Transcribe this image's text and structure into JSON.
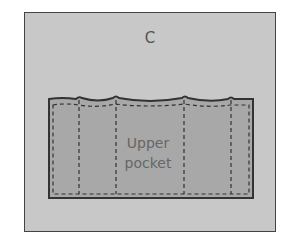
{
  "diagram": {
    "panel_label": "C",
    "pocket": {
      "label_line1": "Upper",
      "label_line2": "pocket"
    },
    "colors": {
      "background": "#c8c8c8",
      "pocket_fill": "#a8a8a8",
      "stroke": "#333333"
    }
  }
}
